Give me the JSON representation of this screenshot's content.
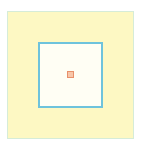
{
  "diagram": {
    "outer_region": {
      "fill": "#fdf8c3",
      "stroke": "#d6ecd8"
    },
    "inner_region": {
      "fill": "#fffef4",
      "stroke": "#6ec3dc"
    },
    "center_marker": {
      "fill": "#f8c6a8",
      "stroke": "#e8906a"
    }
  }
}
